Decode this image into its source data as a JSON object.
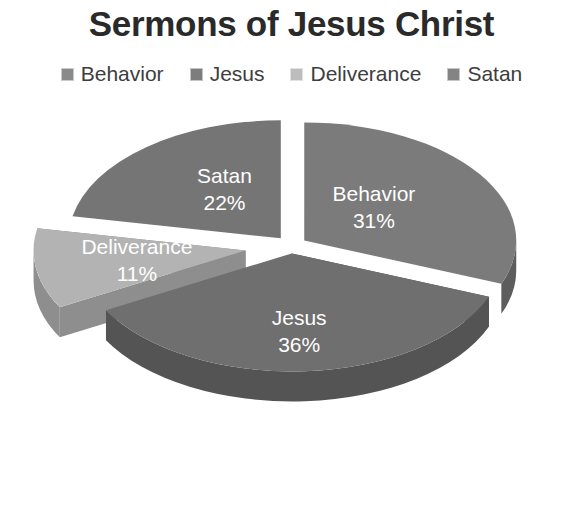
{
  "chart_data": {
    "type": "pie",
    "title": "Sermons of Jesus Christ",
    "xlabel": "",
    "ylabel": "",
    "legend_position": "top",
    "grid": false,
    "three_d": true,
    "exploded": true,
    "unit": "%",
    "categories": [
      "Behavior",
      "Jesus",
      "Deliverance",
      "Satan"
    ],
    "values": [
      31,
      36,
      11,
      22
    ],
    "colors": [
      "#7b7b7b",
      "#6f6f6f",
      "#b3b3b3",
      "#757575"
    ],
    "slices": [
      {
        "label": "Behavior",
        "value": 31,
        "value_text": "31%",
        "color": "#7b7b7b",
        "side_color": "#5d5d5d",
        "legend_swatch": "#8a8a8a"
      },
      {
        "label": "Jesus",
        "value": 36,
        "value_text": "36%",
        "color": "#6f6f6f",
        "side_color": "#545454",
        "legend_swatch": "#7d7d7d"
      },
      {
        "label": "Deliverance",
        "value": 11,
        "value_text": "11%",
        "color": "#b3b3b3",
        "side_color": "#8e8e8e",
        "legend_swatch": "#bdbdbd"
      },
      {
        "label": "Satan",
        "value": 22,
        "value_text": "22%",
        "color": "#757575",
        "side_color": "#595959",
        "legend_swatch": "#848484"
      }
    ]
  },
  "legend": {
    "items": [
      {
        "label": "Behavior"
      },
      {
        "label": "Jesus"
      },
      {
        "label": "Deliverance"
      },
      {
        "label": "Satan"
      }
    ]
  }
}
